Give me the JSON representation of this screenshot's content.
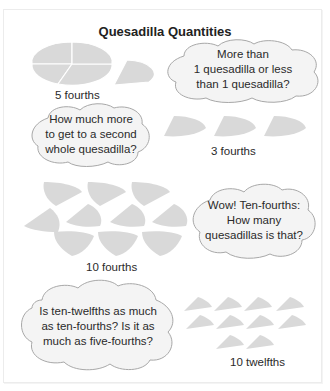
{
  "title": "Quesadilla Quantities",
  "colors": {
    "piece_fill": "#d9d9d9",
    "piece_edge": "#ffffff",
    "cloud_fill": "#f4f4f4",
    "cloud_stroke": "#a8a8a8",
    "text": "#2a2a2a"
  },
  "groups": [
    {
      "id": "five-fourths",
      "label": "5 fourths",
      "pieces": 5,
      "piece_type": "fourth"
    },
    {
      "id": "three-fourths",
      "label": "3 fourths",
      "pieces": 3,
      "piece_type": "fourth"
    },
    {
      "id": "ten-fourths",
      "label": "10 fourths",
      "pieces": 10,
      "piece_type": "fourth"
    },
    {
      "id": "ten-twelfths",
      "label": "10 twelfths",
      "pieces": 10,
      "piece_type": "twelfth"
    }
  ],
  "clouds": [
    {
      "lines": [
        "More than",
        "1 quesadilla or less",
        "than 1 quesadilla?"
      ]
    },
    {
      "lines": [
        "How much more",
        "to get to a second",
        "whole quesadilla?"
      ]
    },
    {
      "lines": [
        "Wow! Ten-fourths:",
        "How many",
        "quesadillas is that?"
      ]
    },
    {
      "lines": [
        "Is ten-twelfths as much",
        "as ten-fourths? Is it as",
        "much as five-fourths?"
      ]
    }
  ]
}
